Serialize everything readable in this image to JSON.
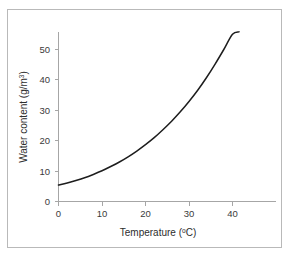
{
  "figure": {
    "frame_color": "#b9b9b9",
    "background": "#ffffff"
  },
  "chart_data": {
    "type": "line",
    "title": "",
    "subtitle": "",
    "xlabel": "Temperature (ºC)",
    "ylabel": "Water content (g/m3)",
    "ylabel_base": "Water content (g/m",
    "ylabel_sup": "3",
    "ylabel_tail": ")",
    "xlabel_base": "Temperature (",
    "xlabel_sup": "o",
    "xlabel_tail": "C)",
    "xlim": [
      0,
      45
    ],
    "ylim": [
      0,
      57
    ],
    "xticks": [
      0,
      10,
      20,
      30,
      40
    ],
    "yticks": [
      0,
      10,
      20,
      30,
      40,
      50
    ],
    "xticklabels": [
      "0",
      "10",
      "20",
      "30",
      "40"
    ],
    "yticklabels": [
      "0",
      "10",
      "20",
      "30",
      "40",
      "50"
    ],
    "grid": false,
    "legend": false,
    "legend_position": "none",
    "line_color": "#1d1d1d",
    "axis_color": "#a6a6a6",
    "series": [
      {
        "name": "Saturation water content of air",
        "x": [
          0,
          2,
          4,
          6,
          8,
          10,
          12,
          14,
          16,
          18,
          20,
          22,
          24,
          26,
          28,
          30,
          32,
          34,
          36,
          38,
          40,
          41.5
        ],
        "y": [
          5.4,
          6.1,
          6.9,
          7.8,
          8.9,
          10.1,
          11.5,
          13.0,
          14.7,
          16.6,
          18.7,
          21.0,
          23.6,
          26.4,
          29.5,
          32.9,
          36.6,
          40.7,
          45.2,
          50.0,
          55.0,
          55.8
        ]
      }
    ]
  }
}
